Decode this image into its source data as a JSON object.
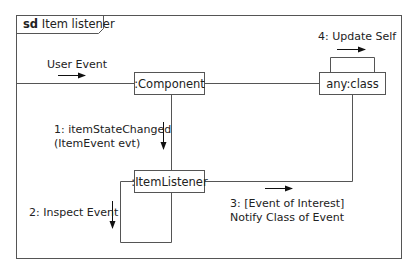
{
  "diagram": {
    "type": "communication",
    "frame": {
      "keyword": "sd",
      "name": "Item listener"
    },
    "objects": [
      {
        "id": "component",
        "label": ":Component"
      },
      {
        "id": "anyclass",
        "label": "any:class"
      },
      {
        "id": "itemlistener",
        "label": ":ItemListener"
      }
    ],
    "messages": [
      {
        "id": "user_event",
        "label": "User Event",
        "to": "component"
      },
      {
        "id": "m1",
        "line1": "1: itemStateChanged",
        "line2": "(ItemEvent evt)",
        "from": "component",
        "to": "itemlistener"
      },
      {
        "id": "m2",
        "label": "2: Inspect Event",
        "from": "itemlistener",
        "to": "itemlistener"
      },
      {
        "id": "m3",
        "line1": "3: [Event of Interest]",
        "line2": "Notify Class of Event",
        "from": "itemlistener",
        "to": "anyclass"
      },
      {
        "id": "m4",
        "label": "4: Update Self",
        "from": "anyclass",
        "to": "anyclass"
      }
    ]
  }
}
